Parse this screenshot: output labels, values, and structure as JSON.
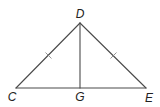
{
  "diagram": {
    "type": "geometry-triangle",
    "points": {
      "D": {
        "label": "D",
        "x": 80,
        "y": 23
      },
      "C": {
        "label": "C",
        "x": 16,
        "y": 88
      },
      "E": {
        "label": "E",
        "x": 146,
        "y": 88
      },
      "G": {
        "label": "G",
        "x": 80,
        "y": 88
      }
    },
    "segments": [
      {
        "from": "C",
        "to": "D",
        "tick_marks": 1
      },
      {
        "from": "D",
        "to": "E",
        "tick_marks": 1
      },
      {
        "from": "C",
        "to": "E",
        "tick_marks": 0
      },
      {
        "from": "D",
        "to": "G",
        "tick_marks": 0
      }
    ],
    "labels": {
      "D": "D",
      "C": "C",
      "E": "E",
      "G": "G"
    },
    "colors": {
      "line": "#4a4a4a",
      "tick": "#8a8a8a",
      "text": "#222222",
      "background": "#ffffff"
    }
  }
}
